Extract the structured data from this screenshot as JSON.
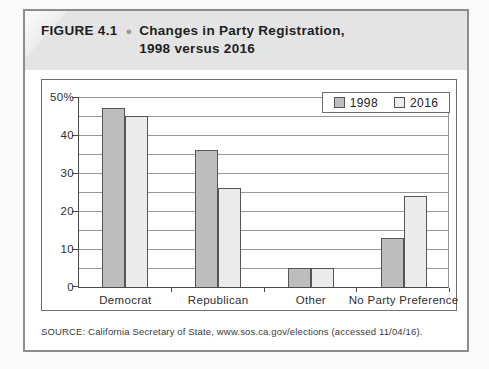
{
  "figure": {
    "label": "FIGURE 4.1",
    "bullet": "●",
    "title_line1": "Changes in Party Registration,",
    "title_line2": "1998 versus 2016"
  },
  "source": "SOURCE: California Secretary of State, www.sos.ca.gov/elections (accessed 11/04/16).",
  "colors": {
    "band_background": "#e4e4e4",
    "series_1998_fill": "#bdbdbd",
    "series_2016_fill": "#ebebeb",
    "bar_border": "#555555",
    "grid_line": "#979797",
    "axis_line": "#4a4a4a"
  },
  "chart_data": {
    "type": "bar",
    "categories": [
      "Democrat",
      "Republican",
      "Other",
      "No Party Preference"
    ],
    "series": [
      {
        "name": "1998",
        "values": [
          47,
          36,
          5,
          13
        ],
        "color": "#bdbdbd"
      },
      {
        "name": "2016",
        "values": [
          45,
          26,
          5,
          24
        ],
        "color": "#ebebeb"
      }
    ],
    "title": "Changes in Party Registration, 1998 versus 2016",
    "xlabel": "",
    "ylabel": "",
    "ylim": [
      0,
      50
    ],
    "y_major_ticks": [
      0,
      10,
      20,
      30,
      40,
      50
    ],
    "y_tick_labels": [
      "0",
      "10",
      "20",
      "30",
      "40",
      "50%"
    ],
    "y_minor_step": 5,
    "grid": "on",
    "legend_position": "top-right"
  }
}
